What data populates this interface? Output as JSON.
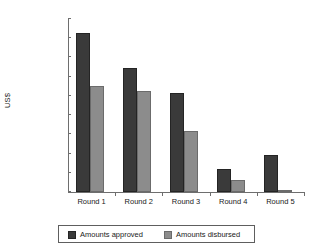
{
  "chart_data": {
    "type": "bar",
    "title": "",
    "xlabel": "",
    "ylabel": "US$",
    "categories": [
      "Round 1",
      "Round 2",
      "Round 3",
      "Round 4",
      "Round 5"
    ],
    "series": [
      {
        "name": "Amounts approved",
        "color": "#3a3a3a",
        "values": [
          165000000,
          129000000,
          103000000,
          24000000,
          39000000
        ]
      },
      {
        "name": "Amounts disbursed",
        "color": "#8c8c8c",
        "values": [
          110000000,
          105000000,
          63000000,
          13000000,
          2000000
        ]
      }
    ],
    "ylim": [
      0,
      180000000
    ],
    "ytick_step": 20000000,
    "ytick_labels": [
      "180,000,000",
      "160,000,000",
      "140,000,000",
      "120,000,000",
      "100,000,000",
      "80,000,000",
      "60,000,000",
      "40,000,000",
      "20,000,000",
      "0"
    ],
    "ytick_values": [
      180000000,
      160000000,
      140000000,
      120000000,
      100000000,
      80000000,
      60000000,
      40000000,
      20000000,
      0
    ],
    "grid": false,
    "legend_position": "bottom"
  },
  "legend": {
    "items": [
      {
        "label": "Amounts approved"
      },
      {
        "label": "Amounts disbursed"
      }
    ]
  },
  "title_remnant": ""
}
